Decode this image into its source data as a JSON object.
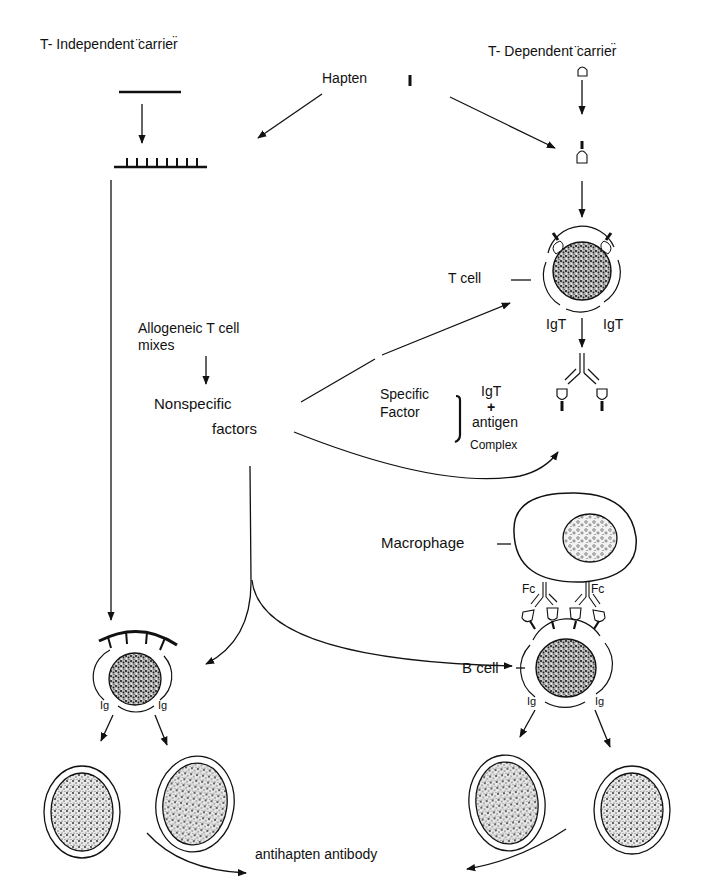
{
  "labels": {
    "t_independent": "T- Independent ̈carrier̈",
    "t_dependent": "T- Dependent ̈carrier̈",
    "hapten": "Hapten",
    "t_cell": "T cell",
    "igt_left": "IgT",
    "igt_right": "IgT",
    "allogeneic_line1": "Allogeneic  T cell",
    "allogeneic_line2": "mixes",
    "nonspecific_line1": "Nonspecific",
    "nonspecific_line2": "factors",
    "specific_line1": "Specific",
    "specific_line2": "Factor",
    "complex_igt": "IgT",
    "complex_plus": "+",
    "complex_antigen": "antigen",
    "complex_word": "Complex",
    "macrophage": "Macrophage",
    "fc_left": "Fc",
    "fc_right": "Fc",
    "b_cell": "B cell",
    "ig_b_left": "Ig",
    "ig_b_right": "Ig",
    "ig_ti_left": "Ig",
    "ig_ti_right": "Ig",
    "output": "antihapten  antibody"
  },
  "nodes": [
    {
      "id": "t_independent_carrier",
      "label": "T- Independent carrier"
    },
    {
      "id": "t_dependent_carrier",
      "label": "T- Dependent carrier"
    },
    {
      "id": "hapten",
      "label": "Hapten"
    },
    {
      "id": "t_cell",
      "label": "T cell"
    },
    {
      "id": "allogeneic_mixes",
      "label": "Allogeneic T cell mixes"
    },
    {
      "id": "nonspecific_factors",
      "label": "Nonspecific factors"
    },
    {
      "id": "specific_factor",
      "label": "Specific Factor (IgT + antigen Complex)"
    },
    {
      "id": "macrophage",
      "label": "Macrophage"
    },
    {
      "id": "b_cell",
      "label": "B cell"
    },
    {
      "id": "ti_b_cell",
      "label": "B cell (T-independent)"
    },
    {
      "id": "plasma_cells",
      "label": "Daughter cells"
    },
    {
      "id": "antihapten_antibody",
      "label": "antihapten antibody"
    }
  ],
  "edges": [
    {
      "from": "hapten",
      "to": "t_independent_carrier"
    },
    {
      "from": "hapten",
      "to": "t_dependent_carrier"
    },
    {
      "from": "t_dependent_carrier",
      "to": "t_cell"
    },
    {
      "from": "t_cell",
      "to": "specific_factor"
    },
    {
      "from": "allogeneic_mixes",
      "to": "nonspecific_factors"
    },
    {
      "from": "nonspecific_factors",
      "to": "t_cell"
    },
    {
      "from": "nonspecific_factors",
      "to": "specific_factor"
    },
    {
      "from": "nonspecific_factors",
      "to": "ti_b_cell"
    },
    {
      "from": "nonspecific_factors",
      "to": "b_cell"
    },
    {
      "from": "t_independent_carrier",
      "to": "ti_b_cell"
    },
    {
      "from": "macrophage",
      "to": "b_cell"
    },
    {
      "from": "ti_b_cell",
      "to": "plasma_cells"
    },
    {
      "from": "b_cell",
      "to": "plasma_cells"
    },
    {
      "from": "plasma_cells",
      "to": "antihapten_antibody"
    }
  ],
  "colors": {
    "ink": "#111111",
    "background": "#ffffff",
    "stipple": "#333333"
  }
}
